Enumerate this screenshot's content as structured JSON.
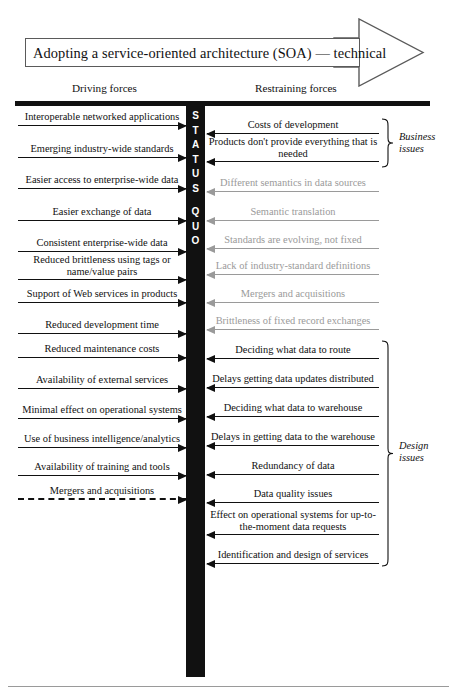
{
  "banner": {
    "title": "Adopting a service-oriented architecture (SOA) — technical",
    "arrow_icon": "right-arrow-banner-icon"
  },
  "columns": {
    "left_caption": "Driving forces",
    "right_caption": "Restraining forces"
  },
  "center_bar": {
    "letters": [
      "S",
      "T",
      "A",
      "T",
      "U",
      "S",
      "Q",
      "U",
      "O"
    ],
    "text": "STATUS QUO",
    "color": "#111111"
  },
  "colors": {
    "ink": "#111111",
    "dimmed": "#9a9a9a",
    "banner_border": "#5a5a5a",
    "rule": "#9a9a9a"
  },
  "driving_forces": [
    {
      "label": "Interoperable networked applications",
      "style": "solid",
      "dimmed": false,
      "y": 126
    },
    {
      "label": "Emerging industry-wide standards",
      "style": "solid",
      "dimmed": false,
      "y": 158
    },
    {
      "label": "Easier access to enterprise-wide data",
      "style": "solid",
      "dimmed": false,
      "y": 189
    },
    {
      "label": "Easier exchange of data",
      "style": "solid",
      "dimmed": false,
      "y": 221
    },
    {
      "label": "Consistent enterprise-wide data",
      "style": "solid",
      "dimmed": false,
      "y": 252
    },
    {
      "label": "Reduced brittleness using tags or name/value pairs",
      "style": "solid",
      "dimmed": false,
      "y": 280,
      "lines": 2
    },
    {
      "label": "Support of Web services in products",
      "style": "solid",
      "dimmed": false,
      "y": 303
    },
    {
      "label": "Reduced development time",
      "style": "solid",
      "dimmed": false,
      "y": 334
    },
    {
      "label": "Reduced maintenance costs",
      "style": "solid",
      "dimmed": false,
      "y": 358
    },
    {
      "label": "Availability of external services",
      "style": "solid",
      "dimmed": false,
      "y": 389
    },
    {
      "label": "Minimal effect on operational systems",
      "style": "solid",
      "dimmed": false,
      "y": 419
    },
    {
      "label": "Use of business intelligence/analytics",
      "style": "solid",
      "dimmed": false,
      "y": 448
    },
    {
      "label": "Availability of training and tools",
      "style": "solid",
      "dimmed": false,
      "y": 476
    },
    {
      "label": "Mergers and acquisitions",
      "style": "dashed",
      "dimmed": false,
      "y": 500
    }
  ],
  "restraining_forces": [
    {
      "label": "Costs of development",
      "dimmed": false,
      "y": 134
    },
    {
      "label": "Products don't provide everything that is needed",
      "dimmed": false,
      "y": 162,
      "lines": 2
    },
    {
      "label": "Different semantics in data sources",
      "dimmed": true,
      "y": 192
    },
    {
      "label": "Semantic translation",
      "dimmed": true,
      "y": 221
    },
    {
      "label": "Standards are evolving, not fixed",
      "dimmed": true,
      "y": 249
    },
    {
      "label": "Lack of industry-standard definitions",
      "dimmed": true,
      "y": 275
    },
    {
      "label": "Mergers and acquisitions",
      "dimmed": true,
      "y": 303
    },
    {
      "label": "Brittleness of fixed record exchanges",
      "dimmed": true,
      "y": 330
    },
    {
      "label": "Deciding what data to route",
      "dimmed": false,
      "y": 359
    },
    {
      "label": "Delays getting data updates distributed",
      "dimmed": false,
      "y": 388
    },
    {
      "label": "Deciding what data to warehouse",
      "dimmed": false,
      "y": 417
    },
    {
      "label": "Delays in getting data to the warehouse",
      "dimmed": false,
      "y": 446
    },
    {
      "label": "Redundancy of data",
      "dimmed": false,
      "y": 475
    },
    {
      "label": "Data quality issues",
      "dimmed": false,
      "y": 503
    },
    {
      "label": "Effect on operational systems for up-to-the-moment data requests",
      "dimmed": false,
      "y": 535,
      "lines": 2
    },
    {
      "label": "Identification and design of services",
      "dimmed": false,
      "y": 564
    }
  ],
  "groups": [
    {
      "name": "business-issues",
      "label_line1": "Business",
      "label_line2": "issues",
      "brace_top": 118,
      "brace_bottom": 168,
      "label_y": 131
    },
    {
      "name": "design-issues",
      "label_line1": "Design",
      "label_line2": "issues",
      "brace_top": 340,
      "brace_bottom": 567,
      "label_y": 440
    }
  ]
}
